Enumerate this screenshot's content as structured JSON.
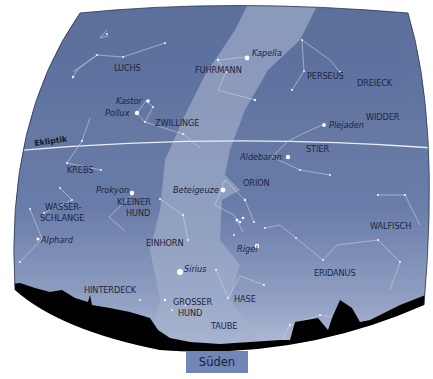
{
  "map": {
    "type": "star-chart",
    "direction_label": "Süden",
    "ecliptic_label": "Ekliptik",
    "colors": {
      "sky_dark": "#5a6f9a",
      "sky_mid": "#7488b3",
      "milky_way": "#9aa8c8",
      "horizon_glow": "#c3cce0",
      "silhouette": "#000000",
      "label": "#1c2540",
      "south_box": "#6f86b6"
    },
    "constellations": [
      {
        "id": "luchs",
        "label": "LUCHS"
      },
      {
        "id": "fuhrmann",
        "label": "FUHRMANN"
      },
      {
        "id": "perseus",
        "label": "PERSEUS"
      },
      {
        "id": "dreieck",
        "label": "DREIECK"
      },
      {
        "id": "widder",
        "label": "WIDDER"
      },
      {
        "id": "zwillinge",
        "label": "ZWILLINGE"
      },
      {
        "id": "stier",
        "label": "STIER"
      },
      {
        "id": "krebs",
        "label": "KREBS"
      },
      {
        "id": "orion",
        "label": "ORION"
      },
      {
        "id": "wasserschlange_1",
        "label": "WASSER-"
      },
      {
        "id": "wasserschlange_2",
        "label": "SCHLANGE"
      },
      {
        "id": "kleiner_hund_1",
        "label": "KLEINER"
      },
      {
        "id": "kleiner_hund_2",
        "label": "HUND"
      },
      {
        "id": "einhorn",
        "label": "EINHORN"
      },
      {
        "id": "walfisch",
        "label": "WALFISCH"
      },
      {
        "id": "eridanus",
        "label": "ERIDANUS"
      },
      {
        "id": "hinterdeck",
        "label": "HINTERDECK"
      },
      {
        "id": "hase",
        "label": "HASE"
      },
      {
        "id": "grosser_hund_1",
        "label": "GROSSER"
      },
      {
        "id": "grosser_hund_2",
        "label": "HUND"
      },
      {
        "id": "taube",
        "label": "TAUBE"
      }
    ],
    "stars": [
      {
        "id": "kapella",
        "label": "Kapella"
      },
      {
        "id": "kastor",
        "label": "Kastor"
      },
      {
        "id": "pollux",
        "label": "Pollux"
      },
      {
        "id": "plejaden",
        "label": "Plejaden"
      },
      {
        "id": "aldebaran",
        "label": "Aldebaran"
      },
      {
        "id": "prokyon",
        "label": "Prokyon"
      },
      {
        "id": "beteigeuze",
        "label": "Beteigeuze"
      },
      {
        "id": "alphard",
        "label": "Alphard"
      },
      {
        "id": "rigel",
        "label": "Rigel"
      },
      {
        "id": "sirius",
        "label": "Sirius"
      }
    ]
  }
}
